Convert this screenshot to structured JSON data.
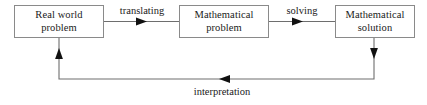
{
  "diagram": {
    "background_color": "#ffffff",
    "line_color": "#6e6e6e",
    "border_color": "#8a8a8a",
    "text_color": "#1a1a1a",
    "nodes": [
      {
        "id": "real-world-problem",
        "line1": "Real world",
        "line2": "problem"
      },
      {
        "id": "mathematical-problem",
        "line1": "Mathematical",
        "line2": "problem"
      },
      {
        "id": "mathematical-solution",
        "line1": "Mathematical",
        "line2": "solution"
      }
    ],
    "edges": [
      {
        "id": "translating",
        "label": "translating",
        "from": "real-world-problem",
        "to": "mathematical-problem",
        "direction": "right"
      },
      {
        "id": "solving",
        "label": "solving",
        "from": "mathematical-problem",
        "to": "mathematical-solution",
        "direction": "right"
      },
      {
        "id": "interpretation",
        "label": "interpretation",
        "from": "mathematical-solution",
        "to": "real-world-problem",
        "direction": "left"
      }
    ]
  }
}
